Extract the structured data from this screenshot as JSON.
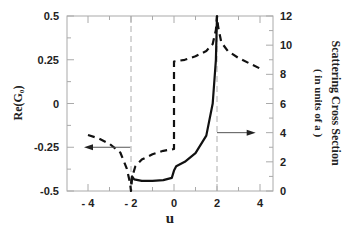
{
  "chart_data": {
    "type": "line",
    "title": "",
    "xlabel": "u",
    "ylabel_left": "Re(G₀)",
    "ylabel_right": "Scattering Cross Section",
    "ylabel_right_sub": "( in units of a )",
    "xlim": [
      -5,
      4.6
    ],
    "ylim_left": [
      -0.5,
      0.5
    ],
    "ylim_right": [
      0,
      12
    ],
    "x_ticks": [
      "- 4",
      "- 2",
      "0",
      "2",
      "4"
    ],
    "x_tick_values": [
      -4,
      -2,
      0,
      2,
      4
    ],
    "y_left_ticks": [
      "0.5",
      "0.25",
      "0",
      "-0.25",
      "-0.5"
    ],
    "y_left_tick_values": [
      0.5,
      0.25,
      0,
      -0.25,
      -0.5
    ],
    "y_right_ticks": [
      "12",
      "10",
      "8",
      "6",
      "4",
      "2",
      "0"
    ],
    "y_right_tick_values": [
      12,
      10,
      8,
      6,
      4,
      2,
      0
    ],
    "grid": false,
    "reference_lines_u": [
      -2,
      2
    ],
    "series": [
      {
        "name": "Re(G0)",
        "axis": "left",
        "style": "dashed",
        "x": [
          -4,
          -3.5,
          -3,
          -2.5,
          -2.2,
          -2.05,
          -2.0,
          -1.95,
          -1.8,
          -1.5,
          -1.0,
          -0.5,
          0.0,
          0.0,
          0.5,
          1.0,
          1.5,
          1.8,
          1.95,
          2.0,
          2.05,
          2.2,
          2.5,
          3.0,
          3.5,
          4.0
        ],
        "y": [
          -0.18,
          -0.2,
          -0.23,
          -0.28,
          -0.37,
          -0.45,
          -0.5,
          -0.42,
          -0.36,
          -0.32,
          -0.29,
          -0.27,
          -0.26,
          0.24,
          0.25,
          0.27,
          0.3,
          0.34,
          0.42,
          0.5,
          0.44,
          0.35,
          0.3,
          0.26,
          0.23,
          0.2
        ]
      },
      {
        "name": "Scattering Cross Section",
        "axis": "right",
        "style": "solid",
        "x": [
          -2.0,
          -1.95,
          -1.85,
          -1.5,
          -1.0,
          -0.5,
          -0.1,
          0.0,
          0.1,
          0.5,
          1.0,
          1.5,
          1.8,
          1.95,
          2.0
        ],
        "y": [
          0.5,
          1.0,
          0.8,
          0.7,
          0.7,
          0.75,
          0.9,
          1.4,
          1.7,
          2.0,
          2.6,
          3.8,
          6.0,
          9.0,
          12.0
        ]
      }
    ],
    "annotations": [
      {
        "type": "arrow",
        "direction": "left",
        "at_u": -2.5,
        "at_left_y": -0.25,
        "meaning": "dashed curve uses left axis"
      },
      {
        "type": "arrow",
        "direction": "right",
        "at_u": 2.0,
        "at_right_y": 4.0,
        "meaning": "solid curve uses right axis"
      }
    ]
  }
}
